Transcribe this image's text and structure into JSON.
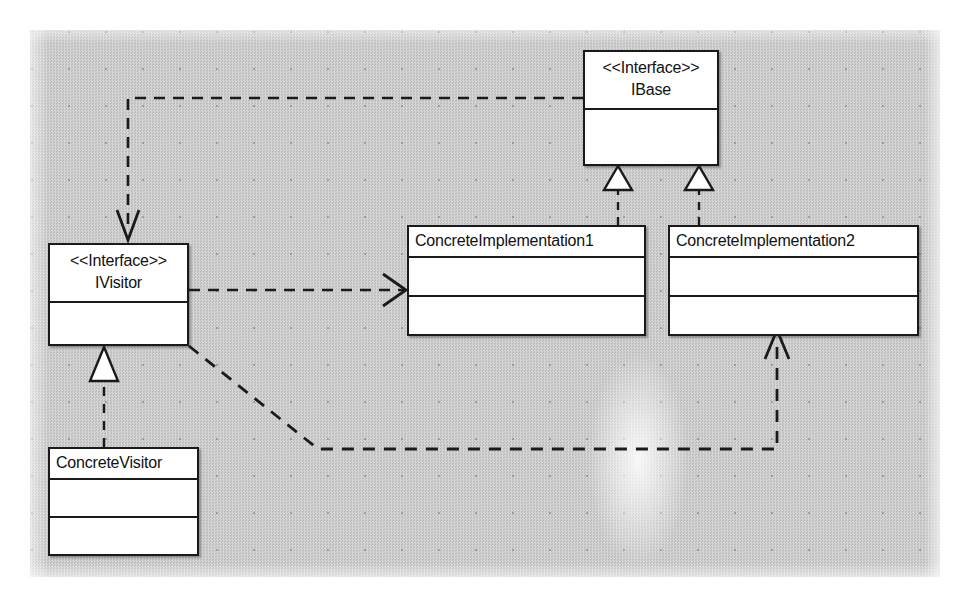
{
  "diagram": {
    "background_color": "#c9c9c9",
    "line_color": "#1a1a1a",
    "box_fill": "#ffffff",
    "classes": [
      {
        "id": "ibase",
        "stereotype": "<<Interface>>",
        "name": "IBase",
        "compartments": 2
      },
      {
        "id": "ivisitor",
        "stereotype": "<<Interface>>",
        "name": "IVisitor",
        "compartments": 2
      },
      {
        "id": "impl1",
        "stereotype": "",
        "name": "ConcreteImplementation1",
        "compartments": 3
      },
      {
        "id": "impl2",
        "stereotype": "",
        "name": "ConcreteImplementation2",
        "compartments": 3
      },
      {
        "id": "concrete-visitor",
        "stereotype": "",
        "name": "ConcreteVisitor",
        "compartments": 3
      }
    ],
    "relationships": [
      {
        "id": "impl1-realizes-ibase",
        "type": "realization",
        "line": "dashed",
        "arrowhead": "hollow-triangle",
        "from": "ConcreteImplementation1",
        "to": "IBase"
      },
      {
        "id": "impl2-realizes-ibase",
        "type": "realization",
        "line": "dashed",
        "arrowhead": "hollow-triangle",
        "from": "ConcreteImplementation2",
        "to": "IBase"
      },
      {
        "id": "concrete-visitor-realizes-ivisitor",
        "type": "realization",
        "line": "dashed",
        "arrowhead": "hollow-triangle",
        "from": "ConcreteVisitor",
        "to": "IVisitor"
      },
      {
        "id": "ibase-depends-ivisitor",
        "type": "dependency",
        "line": "dashed",
        "arrowhead": "open-arrow",
        "from": "IBase",
        "to": "IVisitor"
      },
      {
        "id": "ivisitor-depends-impl1",
        "type": "dependency",
        "line": "dashed",
        "arrowhead": "open-arrow",
        "from": "IVisitor",
        "to": "ConcreteImplementation1"
      },
      {
        "id": "ivisitor-depends-impl2",
        "type": "dependency",
        "line": "dashed",
        "arrowhead": "open-arrow",
        "from": "IVisitor",
        "to": "ConcreteImplementation2"
      }
    ]
  }
}
